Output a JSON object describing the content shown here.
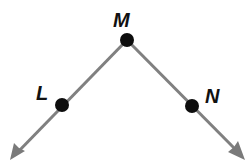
{
  "diagram": {
    "type": "angle",
    "colors": {
      "ray": "#808080",
      "point": "#0d0d0d",
      "label": "#111111",
      "background": "#ffffff"
    },
    "vertex": {
      "label": "M",
      "x": 127,
      "y": 40
    },
    "points": [
      {
        "id": "L",
        "label": "L",
        "x": 62,
        "y": 105,
        "label_x": 36,
        "label_y": 100
      },
      {
        "id": "M",
        "label": "M",
        "x": 127,
        "y": 40,
        "label_x": 114,
        "label_y": 27
      },
      {
        "id": "N",
        "label": "N",
        "x": 192,
        "y": 106,
        "label_x": 205,
        "label_y": 102
      }
    ],
    "rays": [
      {
        "id": "ray-ML",
        "from": "M",
        "through": "L",
        "tip_x": 15,
        "tip_y": 155
      },
      {
        "id": "ray-MN",
        "from": "M",
        "through": "N",
        "tip_x": 241,
        "tip_y": 155
      }
    ]
  }
}
